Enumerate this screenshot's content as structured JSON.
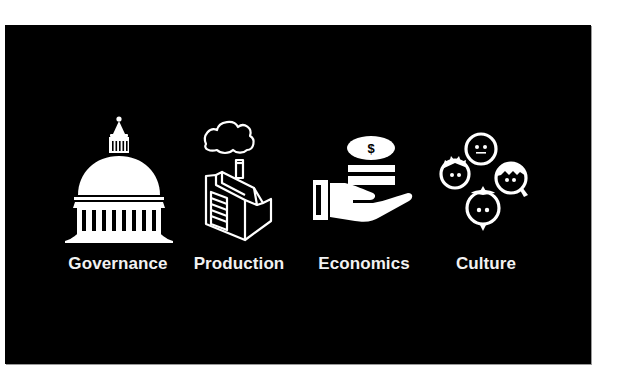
{
  "slide": {
    "background_color": "#000000",
    "foreground_color": "#ffffff",
    "items": [
      {
        "label": "Governance",
        "icon": "capitol-dome-icon"
      },
      {
        "label": "Production",
        "icon": "factory-icon"
      },
      {
        "label": "Economics",
        "icon": "money-hand-icon"
      },
      {
        "label": "Culture",
        "icon": "people-faces-icon"
      }
    ],
    "economics_coin_symbol": "$"
  }
}
